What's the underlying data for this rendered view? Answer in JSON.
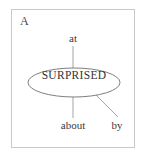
{
  "figure": {
    "panel_label": "A",
    "frame_color": "#c9c9c9",
    "background_color": "#ffffff",
    "text_color": "#3a3a3a",
    "line_color": "#8f8f8f"
  },
  "diagram": {
    "type": "radial-collocation",
    "center": {
      "text": "SURPRISED",
      "shape": "ellipse",
      "cx": 74,
      "cy": 82.5,
      "rx": 46,
      "ry": 14.5
    },
    "satellites": [
      {
        "label": "at",
        "position": "top",
        "connector": "vertical-line",
        "x1": 73,
        "y1": 46,
        "x2": 73,
        "y2": 68
      },
      {
        "label": "about",
        "position": "bottom",
        "connector": "vertical-line",
        "x1": 73,
        "y1": 97,
        "x2": 73,
        "y2": 118
      },
      {
        "label": "by",
        "position": "bottom-right",
        "connector": "diagonal-line",
        "x1": 96,
        "y1": 95,
        "x2": 118,
        "y2": 117
      }
    ]
  }
}
